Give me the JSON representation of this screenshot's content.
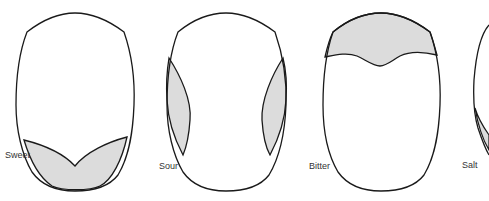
{
  "colors": {
    "outline": "#1a1a1a",
    "fill": "#dcdcdc",
    "background": "#ffffff"
  },
  "panels": [
    {
      "id": "sweet",
      "label": "Sweet",
      "region": "tip"
    },
    {
      "id": "sour",
      "label": "Sour",
      "region": "sides"
    },
    {
      "id": "bitter",
      "label": "Bitter",
      "region": "back"
    },
    {
      "id": "salt",
      "label": "Salt",
      "region": "front sides (partially visible)"
    }
  ]
}
